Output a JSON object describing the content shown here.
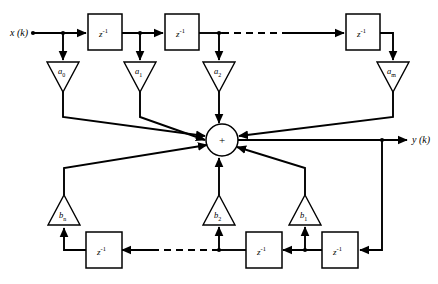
{
  "diagram": {
    "type": "signal-flow-block-diagram",
    "background_color": "#ffffff",
    "line_color": "#000000",
    "input": {
      "label": "x (k)",
      "name": "input-signal"
    },
    "output": {
      "label": "y (k)",
      "name": "output-signal"
    },
    "summing_junction": {
      "symbol": "+",
      "name": "summing-junction"
    },
    "delay_label": {
      "base": "z",
      "exponent": "-1",
      "full": "z-1"
    },
    "feedforward_gains": [
      {
        "base": "a",
        "sub": "0",
        "full": "a0"
      },
      {
        "base": "a",
        "sub": "1",
        "full": "a1"
      },
      {
        "base": "a",
        "sub": "2",
        "full": "a2"
      },
      {
        "base": "a",
        "sub": "m",
        "full": "am"
      }
    ],
    "feedback_gains": [
      {
        "base": "b",
        "sub": "n",
        "full": "bn"
      },
      {
        "base": "b",
        "sub": "2",
        "full": "b2"
      },
      {
        "base": "b",
        "sub": "1",
        "full": "b1"
      }
    ],
    "top_delays": [
      {
        "name": "delay-top-1"
      },
      {
        "name": "delay-top-2"
      },
      {
        "name": "delay-top-3"
      }
    ],
    "bottom_delays": [
      {
        "name": "delay-bottom-1"
      },
      {
        "name": "delay-bottom-2"
      },
      {
        "name": "delay-bottom-3"
      }
    ],
    "ellipsis_note": "dashed line indicates continuation of delay chain"
  }
}
